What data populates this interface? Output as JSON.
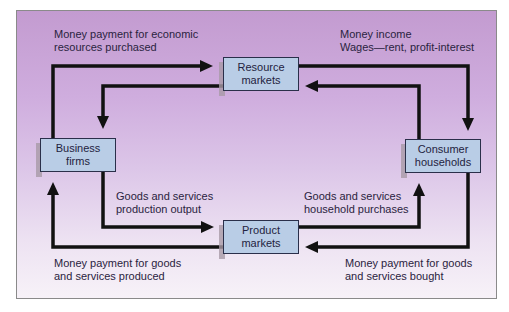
{
  "diagram": {
    "type": "circular-flow",
    "nodes": {
      "resource_markets": {
        "line1": "Resource",
        "line2": "markets"
      },
      "product_markets": {
        "line1": "Product",
        "line2": "markets"
      },
      "business_firms": {
        "line1": "Business",
        "line2": "firms"
      },
      "consumer_households": {
        "line1": "Consumer",
        "line2": "households"
      }
    },
    "labels": {
      "top_left": {
        "line1": "Money payment for economic",
        "line2": "resources purchased"
      },
      "top_right": {
        "line1": "Money income",
        "line2": "Wages—rent, profit-interest"
      },
      "mid_left": {
        "line1": "Goods and services",
        "line2": "production output"
      },
      "mid_right": {
        "line1": "Goods and services",
        "line2": "household purchases"
      },
      "bottom_left": {
        "line1": "Money payment for goods",
        "line2": "and services produced"
      },
      "bottom_right": {
        "line1": "Money payment for goods",
        "line2": "and services bought"
      }
    },
    "flows": [
      {
        "from": "business_firms",
        "to": "resource_markets",
        "label": "top_left"
      },
      {
        "from": "resource_markets",
        "to": "business_firms",
        "label": ""
      },
      {
        "from": "resource_markets",
        "to": "consumer_households",
        "label": "top_right"
      },
      {
        "from": "consumer_households",
        "to": "resource_markets",
        "label": ""
      },
      {
        "from": "business_firms",
        "to": "product_markets",
        "label": "mid_left"
      },
      {
        "from": "product_markets",
        "to": "consumer_households",
        "label": "mid_right"
      },
      {
        "from": "consumer_households",
        "to": "product_markets",
        "label": "bottom_right"
      },
      {
        "from": "product_markets",
        "to": "business_firms",
        "label": "bottom_left"
      }
    ],
    "colors": {
      "panel_top": "#c39bd0",
      "panel_bottom": "#f7f2f8",
      "box_fill": "#b9cde6",
      "arrow": "#111111",
      "text": "#2a2340"
    }
  }
}
